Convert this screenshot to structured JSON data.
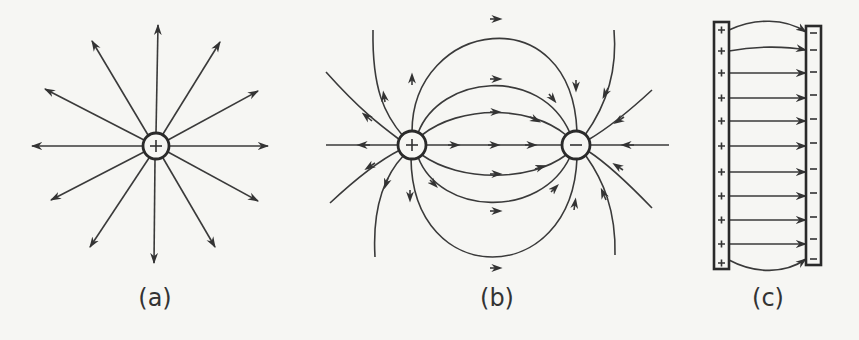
{
  "figure": {
    "panels": [
      {
        "id": "a",
        "label": "(a)",
        "description": "Isolated positive point charge with radial field lines pointing outward",
        "charge": "+",
        "center": [
          156,
          146
        ],
        "line_count": 12
      },
      {
        "id": "b",
        "label": "(b)",
        "description": "Electric dipole: field lines leave the positive charge and enter the negative charge",
        "positive_charge": {
          "sign": "+",
          "center": [
            412,
            145
          ]
        },
        "negative_charge": {
          "sign": "−",
          "center": [
            576,
            145
          ]
        }
      },
      {
        "id": "c",
        "label": "(c)",
        "description": "Parallel plates: positive plate on left, negative plate on right, uniform field between with fringing at edges",
        "left_plate_sign": "+",
        "right_plate_sign": "−",
        "field_line_count": 11
      }
    ],
    "colors": {
      "background": "#f6f6f3",
      "stroke": "#333333"
    }
  }
}
